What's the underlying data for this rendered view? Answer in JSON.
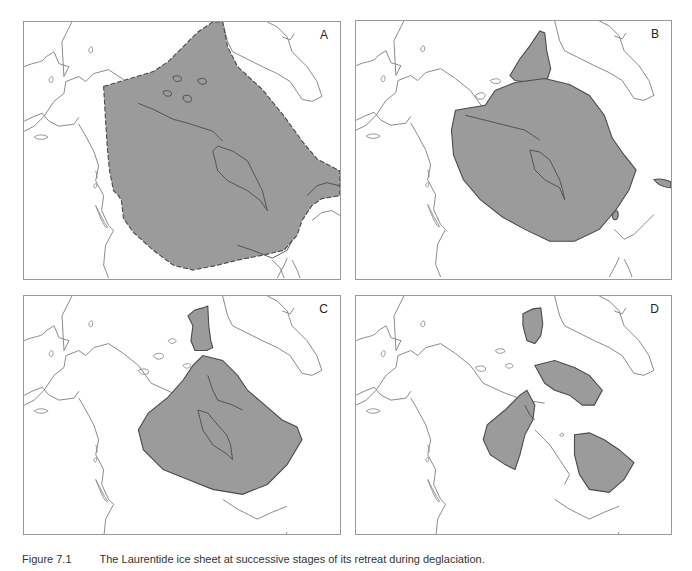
{
  "figure": {
    "panels": [
      {
        "id": "A",
        "label": "A"
      },
      {
        "id": "B",
        "label": "B"
      },
      {
        "id": "C",
        "label": "C"
      },
      {
        "id": "D",
        "label": "D"
      }
    ],
    "caption": {
      "figure_number": "Figure 7.1",
      "text": "The Laurentide ice sheet at successive stages of its retreat during deglaciation."
    },
    "legend": {
      "ice_fill_color": "#9b9b9b",
      "ice_outline_color": "#4a4a4a",
      "coastline_color": "#8a8a8a"
    }
  }
}
